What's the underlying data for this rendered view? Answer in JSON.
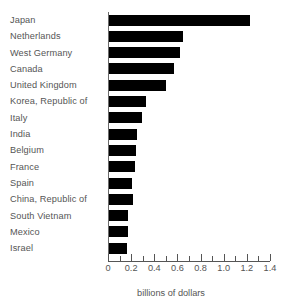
{
  "chart_data": {
    "type": "bar",
    "orientation": "horizontal",
    "title": "",
    "xlabel": "billions of dollars",
    "ylabel": "",
    "xlim": [
      0,
      1.4
    ],
    "grid": false,
    "legend": null,
    "xticks": [
      0,
      0.2,
      0.4,
      0.6,
      0.8,
      1.0,
      1.2,
      1.4
    ],
    "xtick_labels": [
      "0",
      "0.2",
      "0.4",
      "0.6",
      "0.8",
      "1.0",
      "1.2",
      "1.4"
    ],
    "minor_tick_step": 0.1,
    "bar_color": "#000000",
    "axis_color": "#555555",
    "categories": [
      "Japan",
      "Netherlands",
      "West Germany",
      "Canada",
      "United Kingdom",
      "Korea, Republic of",
      "Italy",
      "India",
      "Belgium",
      "France",
      "Spain",
      "China, Republic of",
      "South Vietnam",
      "Mexico",
      "Israel"
    ],
    "values": [
      1.23,
      0.65,
      0.62,
      0.57,
      0.5,
      0.33,
      0.29,
      0.25,
      0.24,
      0.23,
      0.21,
      0.215,
      0.17,
      0.17,
      0.16
    ]
  }
}
